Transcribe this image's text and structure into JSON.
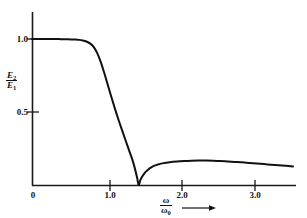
{
  "figure": {
    "background": "#ffffff",
    "axis_color": "#1a1a1a",
    "curve_color": "#111111"
  },
  "axes": {
    "y_label_numerator": "E",
    "y_label_numerator_sub": "2",
    "y_label_denominator": "E",
    "y_label_denominator_sub": "1",
    "x_label_numerator": "ω",
    "x_label_denominator": "ω",
    "x_label_denominator_sub": "0",
    "x_arrow": "arrow-right-icon",
    "x_ticks": [
      "0",
      "1.0",
      "2.0",
      "3.0"
    ],
    "y_ticks": [
      "0.5",
      "1.0"
    ]
  },
  "chart_data": {
    "type": "line",
    "title": "",
    "subtitle": "",
    "xlabel": "ω/ω₀",
    "ylabel": "E₂/E₁",
    "xlim": [
      0,
      3.62
    ],
    "ylim": [
      0,
      1.18
    ],
    "xticks": [
      0,
      1.0,
      2.0,
      3.0
    ],
    "xticklabels": [
      "0",
      "1.0",
      "2.0",
      "3.0"
    ],
    "yticks": [
      0.5,
      1.0
    ],
    "yticklabels": [
      "0.5",
      "1.0"
    ],
    "grid": false,
    "legend": null,
    "series": [
      {
        "name": "E2/E1",
        "x": [
          0.0,
          0.1,
          0.2,
          0.3,
          0.4,
          0.5,
          0.6,
          0.65,
          0.7,
          0.75,
          0.8,
          0.85,
          0.9,
          0.95,
          1.0,
          1.05,
          1.1,
          1.15,
          1.2,
          1.25,
          1.3,
          1.35,
          1.4,
          1.45,
          1.47,
          1.5,
          1.55,
          1.6,
          1.65,
          1.7,
          1.75,
          1.8,
          1.9,
          2.0,
          2.1,
          2.2,
          2.3,
          2.4,
          2.5,
          2.6,
          2.7,
          2.8,
          2.9,
          3.0,
          3.1,
          3.2,
          3.3,
          3.4,
          3.5,
          3.6
        ],
        "y": [
          1.0,
          1.0,
          1.0,
          1.0,
          0.999,
          0.998,
          0.996,
          0.994,
          0.99,
          0.983,
          0.97,
          0.946,
          0.903,
          0.84,
          0.762,
          0.678,
          0.594,
          0.513,
          0.437,
          0.364,
          0.293,
          0.222,
          0.148,
          0.05,
          0.0,
          0.04,
          0.08,
          0.105,
          0.122,
          0.134,
          0.142,
          0.148,
          0.156,
          0.161,
          0.164,
          0.166,
          0.167,
          0.167,
          0.166,
          0.164,
          0.161,
          0.158,
          0.155,
          0.151,
          0.147,
          0.143,
          0.139,
          0.135,
          0.131,
          0.127
        ]
      }
    ],
    "annotations": [
      {
        "text": "minimum at ω/ω₀ ≈ 1.47, E₂/E₁ = 0"
      },
      {
        "text": "flat passband at E₂/E₁ = 1.0 for ω/ω₀ < 0.8"
      }
    ]
  },
  "geometry": {
    "x_axis_y_px": 185,
    "y_axis_x_px": 32,
    "x_origin_px": 32,
    "x_unit_px": 72.5,
    "y_zero_px": 185,
    "y_one_px": 39
  }
}
